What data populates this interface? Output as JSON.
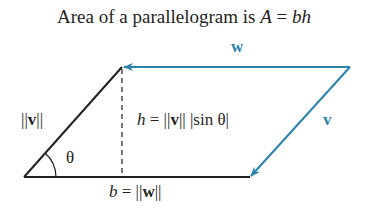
{
  "title": {
    "prefix": "Area of a parallelogram is ",
    "A": "A",
    "eq": " = ",
    "bh": "bh"
  },
  "labels": {
    "w": "w",
    "v": "v",
    "norm_v": {
      "bars_left": "||",
      "vec": "v",
      "bars_right": "||"
    },
    "theta": "θ",
    "height": {
      "h": "h",
      "eq": " = ||",
      "vec": "v",
      "rest": "|| |sin θ|"
    },
    "base": {
      "b": "b",
      "eq": " = ||",
      "vec": "w",
      "rest": "||"
    }
  },
  "colors": {
    "vector_blue": "#2a83ad",
    "line_black": "#231f20"
  },
  "geometry": {
    "bottom_left": [
      24,
      177
    ],
    "top_left": [
      122,
      67
    ],
    "top_right": [
      350,
      67
    ],
    "bottom_right": [
      250,
      177
    ]
  }
}
